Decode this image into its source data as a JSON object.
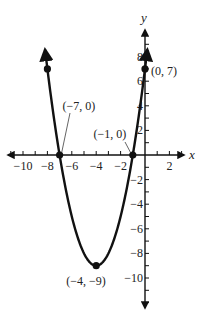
{
  "chart_data": {
    "type": "line",
    "title": "",
    "function": "y = x^2 + 8x + 7",
    "xlabel": "x",
    "ylabel": "y",
    "xlim": [
      -10.5,
      3
    ],
    "ylim": [
      -12,
      10
    ],
    "grid": false,
    "x_ticks": [
      -10,
      -8,
      -6,
      -4,
      -2,
      2
    ],
    "y_ticks": [
      8,
      6,
      4,
      2,
      -2,
      -4,
      -6,
      -8,
      -10
    ],
    "x_tick_labels": [
      "−10",
      "−8",
      "−6",
      "−4",
      "−2",
      "2"
    ],
    "y_tick_labels": [
      "8",
      "6",
      "4",
      "2",
      "−2",
      "−4",
      "−6",
      "−8",
      "−10"
    ],
    "points": [
      {
        "x": -8,
        "y": 7,
        "label": ""
      },
      {
        "x": -7,
        "y": 0,
        "label": "(−7, 0)"
      },
      {
        "x": -4,
        "y": -9,
        "label": "(−4, −9)"
      },
      {
        "x": -1,
        "y": 0,
        "label": "(−1, 0)"
      },
      {
        "x": 0,
        "y": 7,
        "label": "(0, 7)"
      }
    ],
    "annotations": [
      "(−7, 0)",
      "(−1, 0)",
      "(−4, −9)",
      "(0, 7)"
    ],
    "curve_color": "#111111"
  }
}
